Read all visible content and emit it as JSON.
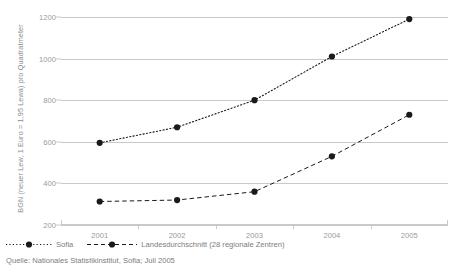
{
  "chart_data": {
    "type": "line",
    "title": "",
    "xlabel": "",
    "ylabel": "BGN (neuer Lew, 1 Euro = 1,95 Lewa) pro Quadratmeter",
    "categories": [
      "2001",
      "2002",
      "2003",
      "2004",
      "2005"
    ],
    "ylim": [
      200,
      1200
    ],
    "yticks": [
      200,
      400,
      600,
      800,
      1000,
      1200
    ],
    "grid": true,
    "legend_position": "bottom-left",
    "series": [
      {
        "name": "Sofia",
        "style": "dotted",
        "marker": "circle",
        "color": "#1a1a1a",
        "values": [
          595,
          670,
          800,
          1010,
          1190
        ]
      },
      {
        "name": "Landesdurchschnitt (28 regionale Zentren)",
        "style": "dashed",
        "marker": "circle",
        "color": "#1a1a1a",
        "values": [
          313,
          320,
          360,
          530,
          730
        ]
      }
    ],
    "source": "Quelle: Nationales Statistikinstitut, Sofia; Juli 2005"
  },
  "axis": {
    "ytick_labels": [
      "1200",
      "1000",
      "800",
      "600",
      "400",
      "200"
    ],
    "xtick_labels": [
      "2001",
      "2002",
      "2003",
      "2004",
      "2005"
    ]
  },
  "legend": {
    "items": [
      {
        "label": "Sofia",
        "marker": "dotted-line-dot-marker"
      },
      {
        "label": "Landesdurchschnitt (28 regionale Zentren)",
        "marker": "dashed-line-dot-marker"
      }
    ]
  },
  "footer": {
    "source": "Quelle: Nationales Statistikinstitut, Sofia; Juli 2005"
  },
  "colors": {
    "grid": "#c9c9c9",
    "text": "#8a8a8a",
    "ink": "#1a1a1a"
  }
}
